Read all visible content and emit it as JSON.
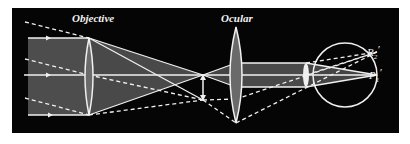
{
  "diagram": {
    "colors": {
      "background": "#050505",
      "page": "#ffffff",
      "ray": "#f0f0f0",
      "beam_fill": "#5a5a5a",
      "lens_fill": "#6a6a6a"
    },
    "labels": {
      "objective": "Objective",
      "ocular": "Ocular",
      "r2_prime": "R",
      "r2_sub": "2",
      "p1_prime": "P",
      "p1_sub": "1",
      "prime_mark": "′"
    },
    "elements": {
      "objective_lens": {
        "x": 89,
        "top": 38,
        "bottom": 115
      },
      "intermediate_image_arrow": {
        "x": 203,
        "top": 75,
        "bottom": 100
      },
      "ocular_lens": {
        "x": 236,
        "top": 27,
        "bottom": 123
      },
      "eye": {
        "cx": 345,
        "cy": 75,
        "r": 32
      },
      "optical_axis_y": 75
    }
  }
}
